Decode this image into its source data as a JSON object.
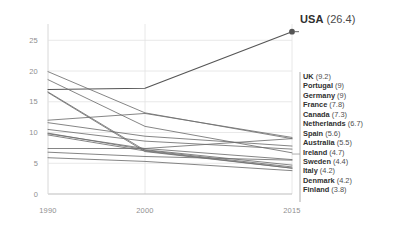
{
  "chart_data": {
    "type": "line",
    "title": "",
    "subtitle": "",
    "xlabel": "",
    "ylabel": "",
    "x": [
      1990,
      2000,
      2015
    ],
    "xtick_labels": [
      "1990",
      "2000",
      "2015"
    ],
    "ytick_labels": [
      "0",
      "5",
      "10",
      "15",
      "20",
      "25"
    ],
    "ytick_values": [
      0,
      5,
      10,
      15,
      20,
      25
    ],
    "ylim": [
      0,
      27
    ],
    "xlim": [
      1990,
      2015
    ],
    "grid": true,
    "legend_position": "right",
    "highlight_series": "USA",
    "series": [
      {
        "name": "USA",
        "label": "USA",
        "value": "26.4",
        "values": [
          17.0,
          17.2,
          26.4
        ],
        "highlight": true
      },
      {
        "name": "UK",
        "label": "UK",
        "value": "9.2",
        "values": [
          12.0,
          13.1,
          9.2
        ],
        "highlight": false
      },
      {
        "name": "Portugal",
        "label": "Portugal",
        "value": "9",
        "values": [
          7.4,
          7.4,
          9.0
        ],
        "highlight": false
      },
      {
        "name": "Germany",
        "label": "Germany",
        "value": "9",
        "values": [
          19.9,
          13.2,
          9.0
        ],
        "highlight": false
      },
      {
        "name": "France",
        "label": "France",
        "value": "7.8",
        "values": [
          11.6,
          9.4,
          7.8
        ],
        "highlight": false
      },
      {
        "name": "Canada",
        "label": "Canada",
        "value": "7.3",
        "values": [
          10.5,
          8.6,
          7.3
        ],
        "highlight": false
      },
      {
        "name": "Netherlands",
        "label": "Netherlands",
        "value": "6.7",
        "values": [
          18.6,
          11.0,
          6.7
        ],
        "highlight": false
      },
      {
        "name": "Spain",
        "label": "Spain",
        "value": "5.6",
        "values": [
          9.8,
          7.4,
          5.6
        ],
        "highlight": false
      },
      {
        "name": "Australia",
        "label": "Australia",
        "value": "5.5",
        "values": [
          6.8,
          6.1,
          5.5
        ],
        "highlight": false
      },
      {
        "name": "Ireland",
        "label": "Ireland",
        "value": "4.7",
        "values": [
          9.9,
          7.2,
          4.7
        ],
        "highlight": false
      },
      {
        "name": "Sweden",
        "label": "Sweden",
        "value": "4.4",
        "values": [
          16.6,
          7.1,
          4.4
        ],
        "highlight": false
      },
      {
        "name": "Italy",
        "label": "Italy",
        "value": "4.2",
        "values": [
          9.6,
          7.0,
          4.2
        ],
        "highlight": false
      },
      {
        "name": "Denmark",
        "label": "Denmark",
        "value": "4.2",
        "values": [
          16.5,
          6.9,
          4.2
        ],
        "highlight": false
      },
      {
        "name": "Finland",
        "label": "Finland",
        "value": "3.8",
        "values": [
          5.9,
          5.3,
          3.8
        ],
        "highlight": false
      }
    ],
    "colors": {
      "line": "#6f6f6f",
      "highlight_line": "#555555",
      "grid": "#e2e2e2",
      "axis": "#bdbdbd",
      "tick_text": "#8f8f8f",
      "label_text": "#303030"
    }
  },
  "usa_annotation": {
    "name": "USA",
    "value": "(26.4)"
  }
}
